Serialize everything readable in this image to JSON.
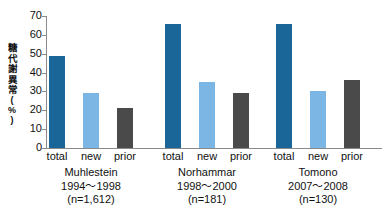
{
  "chart_data": {
    "type": "bar",
    "title": "",
    "xlabel": "",
    "ylabel": "糖代謝異常",
    "yunit": "(%)",
    "ylim": [
      0,
      70
    ],
    "yticks": [
      0,
      10,
      20,
      30,
      40,
      50,
      60,
      70
    ],
    "grid": false,
    "legend": "none",
    "categories": [
      "total",
      "new",
      "prior"
    ],
    "groups": [
      {
        "name": "Muhlestein",
        "period": "1994～1998",
        "n": "(n=1,612)",
        "values": [
          49,
          29,
          21
        ]
      },
      {
        "name": "Norhammar",
        "period": "1998～2000",
        "n": "(n=181)",
        "values": [
          66,
          35,
          29
        ]
      },
      {
        "name": "Tomono",
        "period": "2007～2008",
        "n": "(n=130)",
        "values": [
          66,
          30,
          36
        ]
      }
    ],
    "series": [
      {
        "name": "total",
        "color": "#1a6699",
        "values": [
          49,
          66,
          66
        ]
      },
      {
        "name": "new",
        "color": "#7cb6e4",
        "values": [
          29,
          35,
          30
        ]
      },
      {
        "name": "prior",
        "color": "#4a4a4a",
        "values": [
          21,
          29,
          36
        ]
      }
    ],
    "colors": {
      "total": "#1a6699",
      "new": "#7cb6e4",
      "prior": "#4a4a4a",
      "axis": "#8a8a8a",
      "text": "#111111",
      "background": "#ffffff"
    }
  }
}
